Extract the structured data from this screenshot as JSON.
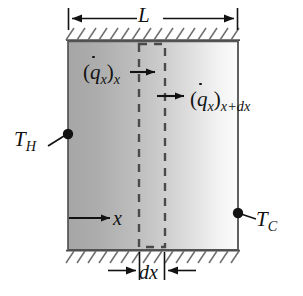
{
  "figure": {
    "name": "one-dimensional-conduction-through-a-plane-wall",
    "labels": {
      "width_dimension": "L",
      "hot_surface_temperature": "T",
      "hot_surface_temperature_sub": "H",
      "cold_surface_temperature": "T",
      "cold_surface_temperature_sub": "C",
      "coordinate_axis": "x",
      "element_thickness": "dx",
      "heat_flux_in_symbol": "q",
      "heat_flux_in_sub_symbol": "x",
      "heat_flux_in_location": "x",
      "heat_flux_out_symbol": "q",
      "heat_flux_out_sub_symbol": "x",
      "heat_flux_out_location": "x+dx",
      "paren_open": "(",
      "paren_close": ")"
    },
    "colors": {
      "line": "#121212",
      "hatch": "#6e6e6e",
      "dashed_control_volume": "#4a4a4a",
      "slab_hot_edge": "#a8a8a8",
      "slab_cold_edge": "#fbfbfb",
      "background": "#ffffff"
    },
    "geometry": {
      "slab_left": 68,
      "slab_right": 238,
      "slab_top": 41,
      "slab_bottom": 250,
      "cv_left": 139,
      "cv_right": 165
    }
  }
}
